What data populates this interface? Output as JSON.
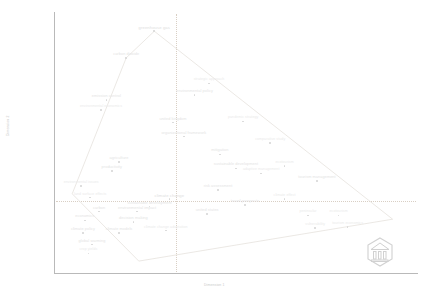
{
  "chart_data": {
    "type": "scatter",
    "title": "",
    "subtitle": "",
    "xlabel": "Dimension 1",
    "ylabel": "Dimension 2",
    "xlim": [
      0,
      100
    ],
    "ylim": [
      0,
      100
    ],
    "grid": false,
    "gridlines": {
      "vertical_x": 34,
      "horizontal_y": 28
    },
    "legend": "none",
    "annotations": {
      "hull_label": "cluster-outline",
      "watermark": "VOSviewer"
    },
    "categories": [
      "greenhouse gas",
      "carbon dioxide",
      "emission control",
      "environmental economics",
      "strategic approach",
      "environmental policy",
      "united kingdom",
      "pandemic strategy",
      "organizational framework",
      "comparative study",
      "mitigation",
      "agriculture",
      "productivity",
      "sustainable development",
      "adaptive management",
      "ecotourism",
      "tourism management",
      "environmental issues",
      "land surface effects",
      "risk assessment",
      "climate change",
      "climate effect",
      "sustainable development",
      "travel prospects",
      "carbon",
      "environmental impact",
      "united states",
      "economics",
      "decision making",
      "peninsular",
      "ecotourism",
      "climate policy",
      "climate change adaptation",
      "vulnerability",
      "tourism economics",
      "climate models",
      "global warming",
      "crop yields"
    ],
    "points": [
      {
        "label": "greenhouse gas",
        "x": 27.3,
        "y": 94.0,
        "weight": 1
      },
      {
        "label": "carbon dioxide",
        "x": 19.5,
        "y": 83.5,
        "weight": 2
      },
      {
        "label": "strategic approach",
        "x": 42.5,
        "y": 73.5,
        "weight": 3
      },
      {
        "label": "environmental policy",
        "x": 38.5,
        "y": 69.0,
        "weight": 2
      },
      {
        "label": "emission control",
        "x": 14.0,
        "y": 67.0,
        "weight": 2
      },
      {
        "label": "environmental economics",
        "x": 12.5,
        "y": 63.0,
        "weight": 3
      },
      {
        "label": "united kingdom",
        "x": 32.5,
        "y": 58.0,
        "weight": 2
      },
      {
        "label": "pandemic strategy",
        "x": 52.0,
        "y": 58.5,
        "weight": 3
      },
      {
        "label": "organizational framework",
        "x": 35.5,
        "y": 52.5,
        "weight": 2
      },
      {
        "label": "comparative study",
        "x": 59.5,
        "y": 50.0,
        "weight": 3
      },
      {
        "label": "mitigation",
        "x": 45.5,
        "y": 45.5,
        "weight": 2
      },
      {
        "label": "agriculture",
        "x": 17.5,
        "y": 42.5,
        "weight": 2
      },
      {
        "label": "productivity",
        "x": 15.5,
        "y": 39.0,
        "weight": 2
      },
      {
        "label": "sustainable development",
        "x": 50.0,
        "y": 40.0,
        "weight": 2
      },
      {
        "label": "adaptive management",
        "x": 57.0,
        "y": 38.0,
        "weight": 3
      },
      {
        "label": "ecotourism",
        "x": 63.5,
        "y": 41.0,
        "weight": 3
      },
      {
        "label": "tourism management",
        "x": 72.5,
        "y": 35.0,
        "weight": 2
      },
      {
        "label": "environmental issues",
        "x": 7.0,
        "y": 33.0,
        "weight": 3
      },
      {
        "label": "risk assessment",
        "x": 45.0,
        "y": 31.5,
        "weight": 2
      },
      {
        "label": "land surface effects",
        "x": 9.5,
        "y": 28.5,
        "weight": 3
      },
      {
        "label": "climate change",
        "x": 31.5,
        "y": 28.0,
        "weight": 1
      },
      {
        "label": "climate effect",
        "x": 63.5,
        "y": 28.0,
        "weight": 3
      },
      {
        "label": "sustainable development",
        "x": 26.0,
        "y": 25.0,
        "weight": 2
      },
      {
        "label": "travel prospects",
        "x": 52.5,
        "y": 25.5,
        "weight": 2
      },
      {
        "label": "carbon",
        "x": 12.0,
        "y": 23.0,
        "weight": 2
      },
      {
        "label": "environmental impact",
        "x": 22.5,
        "y": 23.0,
        "weight": 2
      },
      {
        "label": "united states",
        "x": 42.0,
        "y": 22.0,
        "weight": 2
      },
      {
        "label": "economics",
        "x": 8.0,
        "y": 19.5,
        "weight": 2
      },
      {
        "label": "decision making",
        "x": 21.5,
        "y": 19.0,
        "weight": 2
      },
      {
        "label": "peninsular",
        "x": 70.0,
        "y": 21.5,
        "weight": 3
      },
      {
        "label": "ecotourism",
        "x": 78.5,
        "y": 21.5,
        "weight": 3
      },
      {
        "label": "climate policy",
        "x": 7.5,
        "y": 14.5,
        "weight": 2
      },
      {
        "label": "climate change adaptation",
        "x": 30.5,
        "y": 15.5,
        "weight": 3
      },
      {
        "label": "vulnerability",
        "x": 72.0,
        "y": 16.5,
        "weight": 3
      },
      {
        "label": "tourism economics",
        "x": 81.0,
        "y": 17.0,
        "weight": 3
      },
      {
        "label": "climate models",
        "x": 17.5,
        "y": 14.5,
        "weight": 2
      },
      {
        "label": "global warming",
        "x": 10.0,
        "y": 10.0,
        "weight": 2
      },
      {
        "label": "crop yields",
        "x": 9.0,
        "y": 6.5,
        "weight": 3
      }
    ],
    "hull_vertices": [
      {
        "x": 27.3,
        "y": 94.0
      },
      {
        "x": 93.5,
        "y": 20.0
      },
      {
        "x": 23.0,
        "y": 3.5
      },
      {
        "x": 4.5,
        "y": 30.0
      },
      {
        "x": 19.5,
        "y": 83.5
      }
    ]
  },
  "colors": {
    "background": "#ffffff",
    "axis": "#b9b9b9",
    "guide": "#d9cfc4",
    "hull_stroke": "#e6e2dd",
    "node": "#d8d8d8",
    "label": "#e2e2e2"
  },
  "watermark": {
    "name": "VOSviewer"
  }
}
